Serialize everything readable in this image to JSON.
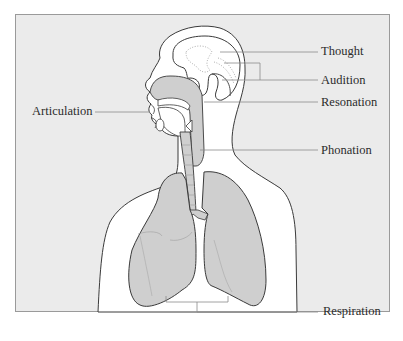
{
  "diagram": {
    "labels": {
      "thought": "Thought",
      "audition": "Audition",
      "resonation": "Resonation",
      "articulation": "Articulation",
      "phonation": "Phonation",
      "respiration": "Respiration"
    },
    "colors": {
      "background_panel": "#ebebeb",
      "organ_fill": "#cfcfcf",
      "outline": "#3a3a3a",
      "leader_line": "#8a8a8a",
      "body_fill": "#ffffff",
      "text": "#2b2b2b"
    }
  }
}
